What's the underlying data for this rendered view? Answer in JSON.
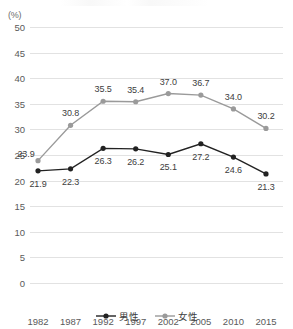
{
  "unit": "(%)",
  "legend": {
    "position": "bottom",
    "items": [
      {
        "label": "男性",
        "color": "#222222",
        "icon": "line-circle-marker"
      },
      {
        "label": "女性",
        "color": "#9a9a9a",
        "icon": "line-circle-marker"
      }
    ]
  },
  "chart_data": {
    "type": "line",
    "title": "",
    "xlabel": "",
    "ylabel": "(%)",
    "ylim": [
      0,
      50
    ],
    "ytick_step": 5,
    "yticks": [
      "0",
      "5",
      "10",
      "15",
      "20",
      "25",
      "30",
      "35",
      "40",
      "45",
      "50"
    ],
    "grid": true,
    "legend_position": "bottom",
    "categories": [
      "1982",
      "1987",
      "1992",
      "1997",
      "2002",
      "2005",
      "2010",
      "2015"
    ],
    "series": [
      {
        "name": "男性",
        "color": "#222222",
        "label_position": "below",
        "values": [
          21.9,
          22.3,
          26.3,
          26.2,
          25.1,
          27.2,
          24.6,
          21.3
        ],
        "labels": [
          "21.9",
          "22.3",
          "26.3",
          "26.2",
          "25.1",
          "27.2",
          "24.6",
          "21.3"
        ]
      },
      {
        "name": "女性",
        "color": "#9a9a9a",
        "label_position": "above",
        "values": [
          23.9,
          30.8,
          35.5,
          35.4,
          37.0,
          36.7,
          34.0,
          30.2
        ],
        "labels": [
          "23.9",
          "30.8",
          "35.5",
          "35.4",
          "37.0",
          "36.7",
          "34.0",
          "30.2"
        ]
      }
    ]
  }
}
